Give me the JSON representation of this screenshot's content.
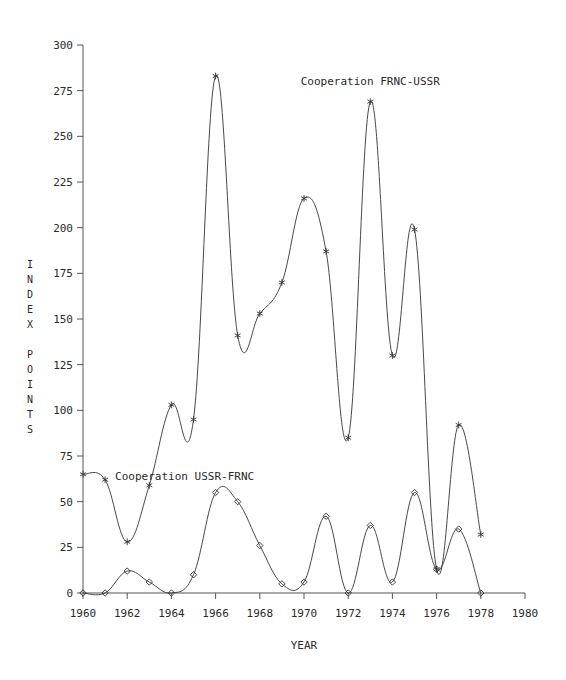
{
  "chart_data": {
    "type": "line",
    "title": "",
    "xlabel": "YEAR",
    "ylabel": "INDEX POINTS",
    "xlim": [
      1960,
      1980
    ],
    "ylim": [
      0,
      300
    ],
    "grid": false,
    "legend_position": "inline-annotation",
    "x": [
      1960,
      1961,
      1962,
      1963,
      1964,
      1965,
      1966,
      1967,
      1968,
      1969,
      1970,
      1971,
      1972,
      1973,
      1974,
      1975,
      1976,
      1977,
      1978
    ],
    "xticks": [
      "1960",
      "1962",
      "1964",
      "1966",
      "1968",
      "1970",
      "1972",
      "1974",
      "1976",
      "1978",
      "1980"
    ],
    "xtick_values": [
      1960,
      1962,
      1964,
      1966,
      1968,
      1970,
      1972,
      1974,
      1976,
      1978,
      1980
    ],
    "yticks": [
      "0",
      "25",
      "50",
      "75",
      "100",
      "125",
      "150",
      "175",
      "200",
      "225",
      "250",
      "275",
      "300"
    ],
    "ytick_values": [
      0,
      25,
      50,
      75,
      100,
      125,
      150,
      175,
      200,
      225,
      250,
      275,
      300
    ],
    "series": [
      {
        "name": "Cooperation FRNC-USSR",
        "marker": "star",
        "label_x": 1973,
        "label_y": 278,
        "values": [
          65,
          62,
          28,
          59,
          103,
          95,
          283,
          141,
          153,
          170,
          216,
          187,
          85,
          269,
          130,
          199,
          13,
          92,
          32
        ]
      },
      {
        "name": "Cooperation USSR-FRNC",
        "marker": "diamond",
        "label_x": 1964.6,
        "label_y": 62,
        "values": [
          0,
          0,
          12,
          6,
          0,
          10,
          55,
          50,
          26,
          5,
          6,
          42,
          0,
          37,
          6,
          55,
          13,
          35,
          0
        ]
      }
    ],
    "colors": {
      "line": "#333333",
      "axis": "#555555",
      "text": "#2a2a2a",
      "background": "#ffffff"
    }
  },
  "labels": {
    "ylabel_index": "INDEX",
    "ylabel_points": "POINTS",
    "xlabel": "YEAR",
    "series_upper": "Cooperation FRNC-USSR",
    "series_lower": "Cooperation USSR-FRNC"
  }
}
